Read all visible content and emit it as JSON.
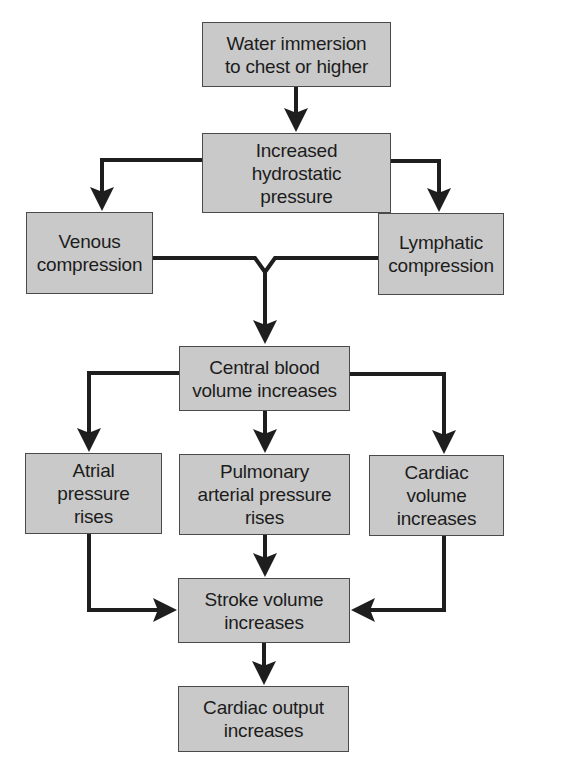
{
  "diagram": {
    "type": "flowchart",
    "colors": {
      "box_fill": "#c9c9c9",
      "box_border": "#4a4a4a",
      "arrow": "#1e1e1e",
      "text": "#1c1c1c"
    },
    "nodes": [
      {
        "id": "water_immersion",
        "label": "Water immersion\nto chest or higher"
      },
      {
        "id": "hydrostatic",
        "label": "Increased\nhydrostatic\npressure"
      },
      {
        "id": "venous",
        "label": "Venous\ncompression"
      },
      {
        "id": "lymphatic",
        "label": "Lymphatic\ncompression"
      },
      {
        "id": "central_blood",
        "label": "Central blood\nvolume increases"
      },
      {
        "id": "atrial",
        "label": "Atrial\npressure\nrises"
      },
      {
        "id": "pulmonary",
        "label": "Pulmonary\narterial pressure\nrises"
      },
      {
        "id": "cardiac_volume",
        "label": "Cardiac\nvolume\nincreases"
      },
      {
        "id": "stroke_volume",
        "label": "Stroke volume\nincreases"
      },
      {
        "id": "cardiac_output",
        "label": "Cardiac output\nincreases"
      }
    ],
    "edges": [
      {
        "from": "water_immersion",
        "to": "hydrostatic"
      },
      {
        "from": "hydrostatic",
        "to": "venous"
      },
      {
        "from": "hydrostatic",
        "to": "lymphatic"
      },
      {
        "from": "venous",
        "to": "central_blood"
      },
      {
        "from": "lymphatic",
        "to": "central_blood"
      },
      {
        "from": "central_blood",
        "to": "atrial"
      },
      {
        "from": "central_blood",
        "to": "pulmonary"
      },
      {
        "from": "central_blood",
        "to": "cardiac_volume"
      },
      {
        "from": "atrial",
        "to": "stroke_volume"
      },
      {
        "from": "pulmonary",
        "to": "stroke_volume"
      },
      {
        "from": "cardiac_volume",
        "to": "stroke_volume"
      },
      {
        "from": "stroke_volume",
        "to": "cardiac_output"
      }
    ]
  }
}
